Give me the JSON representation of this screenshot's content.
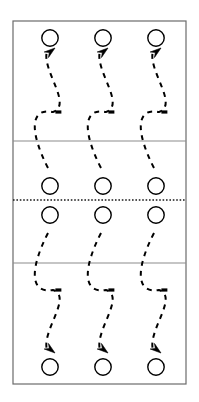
{
  "figure": {
    "background_color": "#ffffff",
    "stroke_color": "#000000",
    "frame_color": "#6b6b6b",
    "divider_color": "#8c8c8c",
    "dotted_divider_color": "#1a1a1a"
  },
  "frame": {
    "x": 13,
    "y": 21,
    "width": 173,
    "height": 363,
    "stroke_width": 1.2
  },
  "dividers": [
    {
      "name": "upper-solid-divider",
      "y": 141,
      "style": "solid",
      "stroke_width": 1.1,
      "color": "#8c8c8c"
    },
    {
      "name": "center-dotted-divider",
      "y": 200,
      "style": "dotted",
      "stroke_width": 1.3,
      "color": "#1a1a1a",
      "dash": "1.6 1.8"
    },
    {
      "name": "lower-solid-divider",
      "y": 263,
      "style": "solid",
      "stroke_width": 1.1,
      "color": "#8c8c8c"
    }
  ],
  "columns": [
    {
      "name": "column-1",
      "cx": 50
    },
    {
      "name": "column-2",
      "cx": 103
    },
    {
      "name": "column-3",
      "cx": 156
    }
  ],
  "circle": {
    "radius": 8.2,
    "stroke_width": 1.4,
    "fill": "none"
  },
  "circle_rows": [
    {
      "name": "circle-row-top",
      "cy": 38
    },
    {
      "name": "circle-row-upper-mid",
      "cy": 186
    },
    {
      "name": "circle-row-lower-mid",
      "cy": 215
    },
    {
      "name": "circle-row-bottom",
      "cy": 367
    }
  ],
  "arrows": {
    "dash_pattern": "5 5",
    "stroke_width": 2.0,
    "head_length": 11,
    "head_width": 7,
    "tick_length": 6,
    "tick_width": 3.2
  },
  "paths": [
    {
      "name": "s-curve-upper",
      "half": "upper",
      "start_y": 168,
      "end_y": 51,
      "mid_tick_y": 112,
      "arrowhead_angle_deg": -38,
      "bulge": 16
    },
    {
      "name": "s-curve-lower",
      "half": "lower",
      "start_y": 233,
      "end_y": 350,
      "mid_tick_y": 290,
      "arrowhead_angle_deg": 38,
      "bulge": 16
    }
  ],
  "counts": {
    "columns": 3,
    "circles_total": 12,
    "arrows_total": 6,
    "dividers_total": 3
  }
}
